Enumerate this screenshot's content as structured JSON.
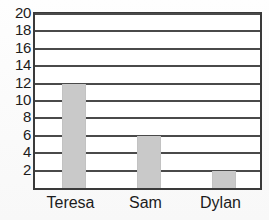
{
  "chart_data": {
    "type": "bar",
    "title": "",
    "subtitle": "",
    "xlabel": "",
    "ylabel": "",
    "categories": [
      "Teresa",
      "Sam",
      "Dylan"
    ],
    "values": [
      12,
      6,
      2
    ],
    "ylim": [
      0,
      20
    ],
    "yticks": [
      2,
      4,
      6,
      8,
      10,
      12,
      14,
      16,
      18,
      20
    ],
    "ytick_labels": [
      "2",
      "4",
      "6",
      "8",
      "10",
      "12",
      "14",
      "16",
      "18",
      "20"
    ],
    "grid": true,
    "grid_axis": "y",
    "legend": false,
    "legend_position": "none",
    "bar_color": "#c9c9c9",
    "axis_color": "#3a3a3a",
    "grid_color": "#4a4a4a",
    "text_color": "#1c1c1c",
    "background_color": "#ffffff",
    "annotations": []
  }
}
